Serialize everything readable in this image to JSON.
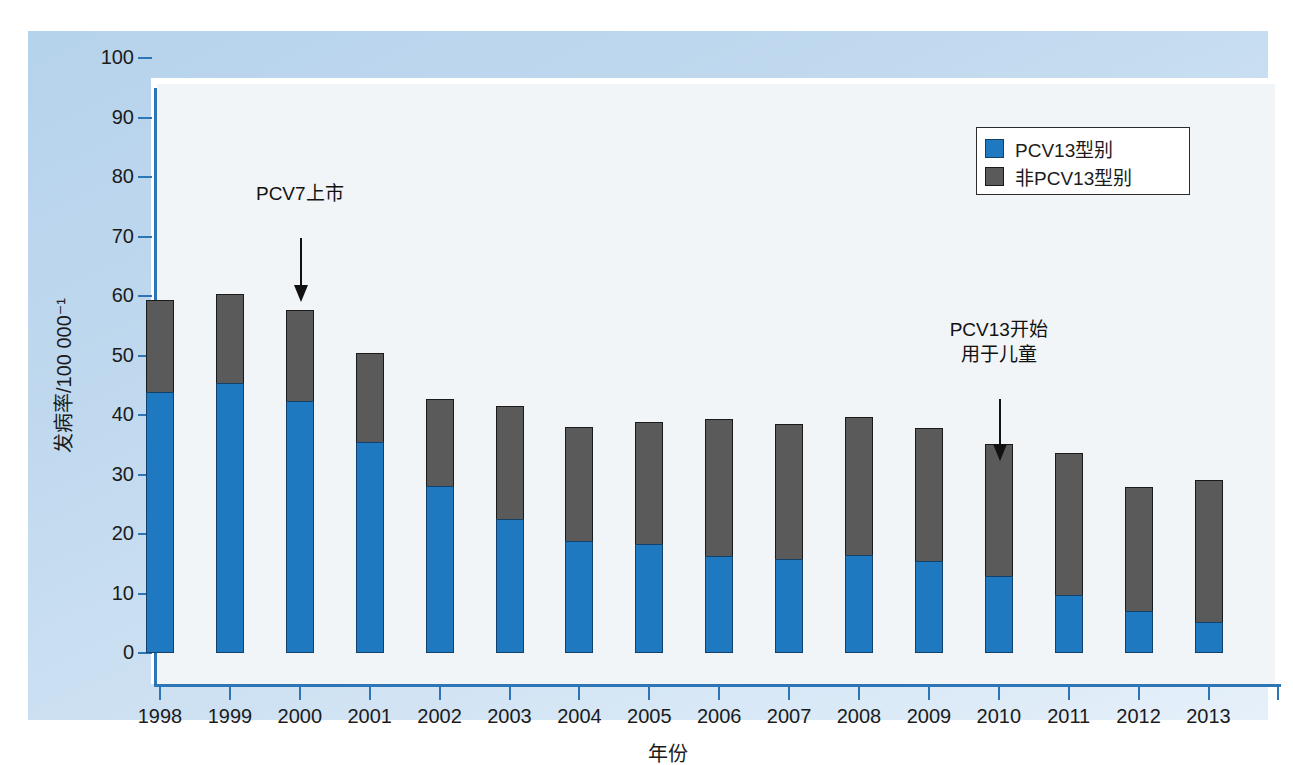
{
  "chart_data": {
    "type": "bar",
    "stacked": true,
    "title": "",
    "xlabel": "年份",
    "ylabel": "发病率/100 000⁻¹",
    "ylim": [
      0,
      100
    ],
    "yticks": [
      0,
      10,
      20,
      30,
      40,
      50,
      60,
      70,
      80,
      90,
      100
    ],
    "grid": false,
    "legend_position": "top-right",
    "categories": [
      "1998",
      "1999",
      "2000",
      "2001",
      "2002",
      "2003",
      "2004",
      "2005",
      "2006",
      "2007",
      "2008",
      "2009",
      "2010",
      "2011",
      "2012",
      "2013"
    ],
    "series": [
      {
        "name": "PCV13型别",
        "color": "#1f79c0",
        "values": [
          43.9,
          45.3,
          42.3,
          35.5,
          28.0,
          22.5,
          18.9,
          18.4,
          16.3,
          15.8,
          16.4,
          15.4,
          13.0,
          9.7,
          7.0,
          5.2
        ]
      },
      {
        "name": "非PCV13型别",
        "color": "#5a5a5a",
        "values": [
          15.5,
          15.1,
          15.3,
          15.0,
          14.7,
          19.0,
          19.0,
          20.5,
          23.1,
          22.7,
          23.3,
          22.4,
          22.2,
          23.9,
          20.9,
          23.9
        ]
      }
    ],
    "totals": [
      59.4,
      60.4,
      57.6,
      50.5,
      42.7,
      41.5,
      37.9,
      38.9,
      39.4,
      38.5,
      39.7,
      37.8,
      35.2,
      33.6,
      27.9,
      29.1
    ],
    "annotations": [
      {
        "name": "pcv7-launch",
        "lines": [
          "PCV7上市"
        ],
        "target_category": "2000"
      },
      {
        "name": "pcv13-children",
        "lines": [
          "PCV13开始",
          "用于儿童"
        ],
        "target_category": "2010"
      }
    ]
  },
  "legend": {
    "items": [
      {
        "label": "PCV13型别",
        "swatch": "blue"
      },
      {
        "label": "非PCV13型别",
        "swatch": "gray"
      }
    ]
  },
  "colors": {
    "series_pcv13": "#1f79c0",
    "series_non_pcv13": "#5a5a5a",
    "axis": "#2e75b6",
    "panel_background": "#c2daef",
    "plot_background": "#f2f5f7"
  }
}
